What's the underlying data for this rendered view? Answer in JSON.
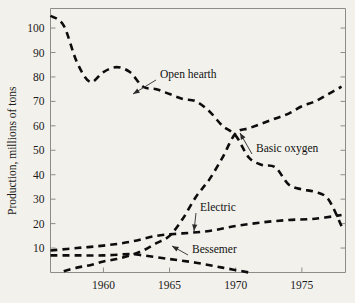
{
  "figure": {
    "background_color": "#f3f1ec",
    "line_color": "#0d0d0d",
    "axis_color": "#8d8d88"
  },
  "axes": {
    "ylabel": "Production, millions of tons",
    "xlabel": "",
    "y_ticks": [
      10,
      20,
      30,
      40,
      50,
      60,
      70,
      80,
      90,
      100
    ],
    "y_tick_labels": [
      "10",
      "20",
      "30",
      "40",
      "50",
      "60",
      "70",
      "80",
      "90",
      "100"
    ],
    "x_ticks": [
      1960,
      1965,
      1970,
      1975
    ],
    "x_tick_labels": [
      "1960",
      "1965",
      "1970",
      "1975"
    ],
    "xlim": [
      1956,
      1978.3
    ],
    "ylim": [
      0,
      108
    ]
  },
  "annotations": [
    {
      "name": "open-hearth",
      "text": "Open hearth",
      "text_x": 160,
      "text_y": 78,
      "tip_x": 133,
      "tip_y": 94
    },
    {
      "name": "basic-oxygen",
      "text": "Basic oxygen",
      "text_x": 256,
      "text_y": 152,
      "tip_x": 240,
      "tip_y": 133
    },
    {
      "name": "electric",
      "text": "Electric",
      "text_x": 200,
      "text_y": 211,
      "tip_x": 194,
      "tip_y": 231
    },
    {
      "name": "bessemer",
      "text": "Bessemer",
      "text_x": 192,
      "text_y": 253,
      "tip_x": 172,
      "tip_y": 246
    }
  ],
  "chart_data": {
    "type": "line",
    "title": "",
    "subtitle": "",
    "xlabel": "",
    "ylabel": "Production, millions of tons",
    "xlim": [
      1956,
      1978.3
    ],
    "ylim": [
      0,
      108
    ],
    "grid": false,
    "legend": "inline annotations with leader arrows",
    "linestyle": "dashed",
    "series": [
      {
        "name": "Open hearth",
        "x": [
          1956,
          1957,
          1958,
          1959,
          1960,
          1961,
          1962,
          1963,
          1964,
          1965,
          1966,
          1967,
          1968,
          1969,
          1970,
          1971,
          1972,
          1973,
          1974,
          1975,
          1976,
          1977,
          1978
        ],
        "values": [
          105,
          101,
          86,
          78,
          82,
          84,
          82,
          76,
          75,
          73,
          71,
          70,
          66,
          60,
          56,
          47,
          44,
          43,
          36,
          34,
          33,
          30,
          19
        ]
      },
      {
        "name": "Basic oxygen",
        "x": [
          1957,
          1958,
          1959,
          1960,
          1961,
          1962,
          1963,
          1964,
          1965,
          1966,
          1967,
          1968,
          1969,
          1970,
          1971,
          1972,
          1973,
          1974,
          1975,
          1976,
          1977,
          1978
        ],
        "values": [
          0.5,
          2,
          3,
          4.5,
          5.5,
          7,
          9,
          12,
          15,
          22,
          31,
          38,
          47,
          57,
          59,
          61,
          63,
          65,
          68,
          70,
          73,
          76
        ]
      },
      {
        "name": "Electric",
        "x": [
          1956,
          1958,
          1960,
          1962,
          1964,
          1966,
          1968,
          1970,
          1972,
          1974,
          1976,
          1978
        ],
        "values": [
          9,
          10,
          11,
          12.5,
          15,
          16,
          17,
          19,
          20.5,
          21.5,
          22,
          23.5
        ]
      },
      {
        "name": "Bessemer",
        "x": [
          1956,
          1958,
          1960,
          1962,
          1963,
          1965,
          1967,
          1969,
          1971
        ],
        "values": [
          7,
          7,
          7,
          7.5,
          7,
          5.5,
          4,
          2,
          0
        ]
      }
    ]
  }
}
